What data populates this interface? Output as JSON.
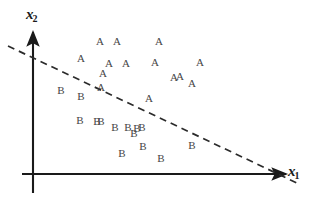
{
  "figure": {
    "background_color": "#ffffff",
    "width": 314,
    "height": 204
  },
  "axes": {
    "x_axis": {
      "name": "x1",
      "label_base": "x",
      "label_sub": "1",
      "color": "#1a1a1a",
      "origin_px": {
        "x": 33,
        "y": 174
      },
      "end_px": {
        "x": 289,
        "y": 174
      },
      "arrow": "right"
    },
    "y_axis": {
      "name": "x2",
      "label_base": "x",
      "label_sub": "2",
      "color": "#1a1a1a",
      "origin_px": {
        "x": 33,
        "y": 174
      },
      "end_px": {
        "x": 33,
        "y": 30
      },
      "tail_px": {
        "x": 33,
        "y": 193
      },
      "arrow": "up"
    }
  },
  "decision_boundary": {
    "name": "dashed-separating-line",
    "style": "dashed",
    "color": "#2b2b2b",
    "stroke_width": 1.6,
    "dash_pattern": "7 5",
    "start_px": {
      "x": 8,
      "y": 46
    },
    "end_px": {
      "x": 297,
      "y": 183
    }
  },
  "chart_data": {
    "type": "scatter",
    "title": "",
    "xlabel": "x1",
    "ylabel": "x2",
    "grid": false,
    "legend": "none",
    "classes": [
      "A",
      "B"
    ],
    "series": [
      {
        "name": "A",
        "label": "A",
        "count": 14,
        "points_px": [
          {
            "x": 100,
            "y": 41
          },
          {
            "x": 117,
            "y": 41
          },
          {
            "x": 159,
            "y": 41
          },
          {
            "x": 81,
            "y": 58
          },
          {
            "x": 109,
            "y": 63
          },
          {
            "x": 126,
            "y": 63
          },
          {
            "x": 155,
            "y": 62
          },
          {
            "x": 200,
            "y": 62
          },
          {
            "x": 180,
            "y": 76
          },
          {
            "x": 192,
            "y": 83
          },
          {
            "x": 103,
            "y": 73
          },
          {
            "x": 101,
            "y": 87
          },
          {
            "x": 149,
            "y": 98
          },
          {
            "x": 174,
            "y": 77
          }
        ]
      },
      {
        "name": "B",
        "label": "B",
        "count": 14,
        "points_px": [
          {
            "x": 61,
            "y": 90
          },
          {
            "x": 81,
            "y": 96
          },
          {
            "x": 80,
            "y": 120
          },
          {
            "x": 101,
            "y": 121
          },
          {
            "x": 115,
            "y": 127
          },
          {
            "x": 128,
            "y": 127
          },
          {
            "x": 134,
            "y": 133
          },
          {
            "x": 142,
            "y": 127
          },
          {
            "x": 143,
            "y": 146
          },
          {
            "x": 122,
            "y": 153
          },
          {
            "x": 161,
            "y": 158
          },
          {
            "x": 192,
            "y": 145
          },
          {
            "x": 97,
            "y": 121
          },
          {
            "x": 137,
            "y": 128
          }
        ]
      }
    ]
  }
}
